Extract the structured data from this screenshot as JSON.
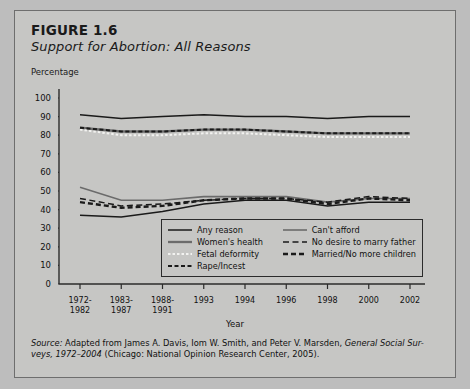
{
  "figure": {
    "number": "FIGURE 1.6",
    "subtitle": "Support for Abortion: All Reasons",
    "y_axis_label": "Percentage",
    "x_axis_label": "Year"
  },
  "source": {
    "lead": "Source:",
    "text_part1": " Adapted from James A. Davis, Iom W. Smith, and Peter V. Marsden, ",
    "italic1": "General Social Sur-",
    "text_part2": "veys, 1972–2004",
    "text_part3": " (Chicago: National Opinion Research Center, 2005)."
  },
  "colors": {
    "figure_bg": "#c6c6c4",
    "figure_border": "#6e6e6e",
    "axis": "#2b2b2b",
    "dark_line": "#1a1a1a",
    "gray_line": "#6b6b6b",
    "light_line": "#f2f2f0",
    "text": "#111111"
  },
  "legend": {
    "column_left": [
      {
        "label": "Any reason",
        "style": "solid-dark"
      },
      {
        "label": "Women's health",
        "style": "solid-gray-thick"
      },
      {
        "label": "Fetal deformity",
        "style": "dotted-light"
      },
      {
        "label": "Rape/Incest",
        "style": "dashed-dark-short"
      }
    ],
    "column_right": [
      {
        "label": "Can't afford",
        "style": "solid-gray"
      },
      {
        "label": "No desire to marry father",
        "style": "dashed-dark-long"
      },
      {
        "label": "Married/No more children",
        "style": "dashed-dark-thick"
      }
    ]
  },
  "chart_data": {
    "type": "line",
    "title": "Support for Abortion: All Reasons",
    "xlabel": "Year",
    "ylabel": "Percentage",
    "ylim": [
      0,
      100
    ],
    "ytick_step": 10,
    "yticks": [
      0,
      10,
      20,
      30,
      40,
      50,
      60,
      70,
      80,
      90,
      100
    ],
    "grid": false,
    "legend_position": "inside-bottom-center",
    "categories": [
      "1972-\n1982",
      "1983-\n1987",
      "1988-\n1991",
      "1993",
      "1994",
      "1996",
      "1998",
      "2000",
      "2002"
    ],
    "categories_flat": [
      "1972-1982",
      "1983-1987",
      "1988-1991",
      "1993",
      "1994",
      "1996",
      "1998",
      "2000",
      "2002"
    ],
    "series": [
      {
        "name": "Any reason",
        "style": "solid-dark",
        "values": [
          91,
          89,
          90,
          91,
          90,
          90,
          89,
          90,
          90
        ]
      },
      {
        "name": "Women's health",
        "style": "solid-gray-thick",
        "values": [
          84,
          82,
          82,
          83,
          83,
          82,
          81,
          81,
          81
        ]
      },
      {
        "name": "Fetal deformity",
        "style": "dotted-light",
        "values": [
          83,
          80,
          80,
          81,
          81,
          80,
          79,
          79,
          79
        ]
      },
      {
        "name": "Rape/Incest",
        "style": "dashed-dark-short",
        "values": [
          84,
          82,
          82,
          83,
          83,
          82,
          81,
          81,
          81
        ]
      },
      {
        "name": "Can't afford",
        "style": "solid-gray",
        "values": [
          52,
          45,
          45,
          47,
          47,
          47,
          44,
          46,
          46
        ]
      },
      {
        "name": "No desire to marry father",
        "style": "dashed-dark-long",
        "values": [
          46,
          42,
          43,
          45,
          46,
          46,
          44,
          47,
          46
        ]
      },
      {
        "name": "Married/No more children",
        "style": "dashed-dark-thick",
        "values": [
          44,
          41,
          42,
          45,
          46,
          46,
          43,
          46,
          45
        ]
      },
      {
        "name": "Any reason (low band)",
        "style": "solid-dark",
        "values": [
          37,
          36,
          39,
          43,
          45,
          45,
          42,
          44,
          44
        ]
      }
    ]
  }
}
